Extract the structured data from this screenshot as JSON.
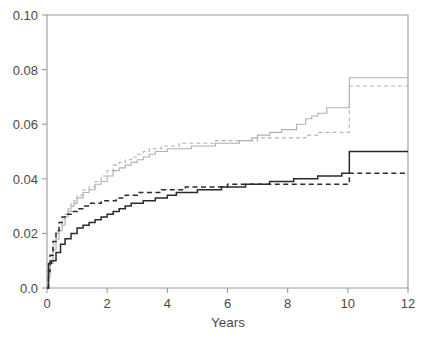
{
  "chart_data": {
    "type": "line",
    "title": "",
    "subtitle": "",
    "xlabel": "Years",
    "ylabel": "",
    "xlim": [
      0,
      12
    ],
    "ylim": [
      0.0,
      0.1
    ],
    "grid": false,
    "legend_position": "none",
    "xticks": [
      0,
      2,
      4,
      6,
      8,
      10,
      12
    ],
    "xtick_labels": [
      "0",
      "2",
      "4",
      "6",
      "8",
      "10",
      "12"
    ],
    "yticks": [
      0.0,
      0.02,
      0.04,
      0.06,
      0.08,
      0.1
    ],
    "ytick_labels": [
      "0.0",
      "0.02",
      "0.04",
      "0.06",
      "0.08",
      "0.10"
    ],
    "annotations": [],
    "series": [
      {
        "name": "gray-solid",
        "style": "solid",
        "color": "#b0b0b0",
        "step": "post",
        "x": [
          0.0,
          0.05,
          0.1,
          0.2,
          0.3,
          0.4,
          0.5,
          0.6,
          0.7,
          0.8,
          0.9,
          1.0,
          1.2,
          1.4,
          1.6,
          1.8,
          2.0,
          2.2,
          2.4,
          2.6,
          2.8,
          3.0,
          3.2,
          3.4,
          3.6,
          3.8,
          4.0,
          4.4,
          4.8,
          5.2,
          5.6,
          6.0,
          6.4,
          6.8,
          7.0,
          7.4,
          7.8,
          8.0,
          8.3,
          8.6,
          8.8,
          9.0,
          9.3,
          9.6,
          10.0,
          10.05,
          12.0
        ],
        "y": [
          0.0,
          0.004,
          0.009,
          0.014,
          0.018,
          0.021,
          0.023,
          0.026,
          0.028,
          0.03,
          0.031,
          0.033,
          0.035,
          0.036,
          0.038,
          0.039,
          0.041,
          0.043,
          0.044,
          0.045,
          0.046,
          0.047,
          0.048,
          0.049,
          0.05,
          0.05,
          0.051,
          0.051,
          0.052,
          0.052,
          0.053,
          0.053,
          0.054,
          0.055,
          0.056,
          0.057,
          0.058,
          0.058,
          0.06,
          0.062,
          0.063,
          0.064,
          0.066,
          0.066,
          0.066,
          0.077,
          0.077
        ]
      },
      {
        "name": "gray-dashed",
        "style": "dashed",
        "color": "#b4b4b4",
        "step": "post",
        "x": [
          0.0,
          0.05,
          0.1,
          0.2,
          0.3,
          0.4,
          0.5,
          0.6,
          0.7,
          0.8,
          0.9,
          1.0,
          1.2,
          1.4,
          1.6,
          1.8,
          2.0,
          2.2,
          2.4,
          2.6,
          2.8,
          3.0,
          3.2,
          3.4,
          3.6,
          3.8,
          4.0,
          4.4,
          4.8,
          5.2,
          5.6,
          6.0,
          6.5,
          7.0,
          7.5,
          8.0,
          8.6,
          9.0,
          10.0,
          10.05,
          12.0
        ],
        "y": [
          0.0,
          0.005,
          0.011,
          0.016,
          0.02,
          0.023,
          0.025,
          0.027,
          0.029,
          0.031,
          0.032,
          0.034,
          0.036,
          0.037,
          0.039,
          0.041,
          0.043,
          0.045,
          0.046,
          0.047,
          0.048,
          0.049,
          0.05,
          0.051,
          0.051,
          0.052,
          0.052,
          0.053,
          0.053,
          0.053,
          0.054,
          0.054,
          0.054,
          0.055,
          0.055,
          0.055,
          0.056,
          0.057,
          0.057,
          0.074,
          0.074
        ]
      },
      {
        "name": "black-solid",
        "style": "solid",
        "color": "#2b2b2b",
        "step": "post",
        "x": [
          0.0,
          0.05,
          0.15,
          0.3,
          0.45,
          0.6,
          0.8,
          1.0,
          1.2,
          1.4,
          1.6,
          1.8,
          2.0,
          2.2,
          2.4,
          2.6,
          2.8,
          3.0,
          3.2,
          3.4,
          3.6,
          3.8,
          4.0,
          4.3,
          4.6,
          5.0,
          5.4,
          5.8,
          6.2,
          6.6,
          7.0,
          7.4,
          7.8,
          8.2,
          8.6,
          9.0,
          9.4,
          9.8,
          10.0,
          10.05,
          12.0
        ],
        "y": [
          0.0,
          0.009,
          0.01,
          0.013,
          0.016,
          0.018,
          0.02,
          0.022,
          0.023,
          0.024,
          0.025,
          0.026,
          0.027,
          0.028,
          0.029,
          0.03,
          0.031,
          0.031,
          0.032,
          0.032,
          0.033,
          0.033,
          0.034,
          0.035,
          0.035,
          0.036,
          0.036,
          0.037,
          0.037,
          0.038,
          0.038,
          0.039,
          0.039,
          0.04,
          0.04,
          0.041,
          0.041,
          0.042,
          0.042,
          0.05,
          0.05
        ]
      },
      {
        "name": "black-dashed",
        "style": "dashed",
        "color": "#2b2b2b",
        "step": "post",
        "x": [
          0.0,
          0.05,
          0.1,
          0.2,
          0.3,
          0.4,
          0.5,
          0.6,
          0.8,
          1.0,
          1.2,
          1.4,
          1.6,
          1.8,
          2.0,
          2.3,
          2.6,
          3.0,
          3.4,
          3.8,
          4.2,
          4.6,
          5.0,
          5.5,
          6.0,
          6.5,
          7.0,
          7.5,
          8.0,
          8.5,
          9.0,
          9.5,
          10.0,
          10.05,
          12.0
        ],
        "y": [
          0.0,
          0.006,
          0.012,
          0.017,
          0.021,
          0.024,
          0.026,
          0.027,
          0.028,
          0.029,
          0.03,
          0.031,
          0.031,
          0.032,
          0.032,
          0.033,
          0.034,
          0.035,
          0.035,
          0.036,
          0.036,
          0.037,
          0.037,
          0.037,
          0.038,
          0.038,
          0.038,
          0.038,
          0.038,
          0.038,
          0.038,
          0.038,
          0.038,
          0.042,
          0.042
        ]
      }
    ]
  }
}
